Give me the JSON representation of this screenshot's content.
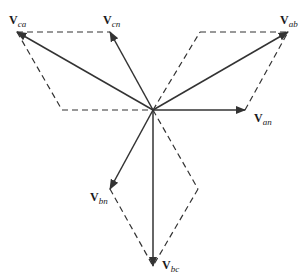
{
  "diagram": {
    "type": "phasor-diagram",
    "stroke_color": "#333333",
    "origin": {
      "x": 153,
      "y": 110
    },
    "phasors": [
      {
        "id": "van",
        "main": "V",
        "sub": "an",
        "tip": {
          "x": 245,
          "y": 110
        }
      },
      {
        "id": "vab",
        "main": "V",
        "sub": "ab",
        "tip": {
          "x": 288,
          "y": 32
        }
      },
      {
        "id": "vcn",
        "main": "V",
        "sub": "cn",
        "tip": {
          "x": 110,
          "y": 32
        }
      },
      {
        "id": "vca",
        "main": "V",
        "sub": "ca",
        "tip": {
          "x": 17,
          "y": 32
        }
      },
      {
        "id": "vbn",
        "main": "V",
        "sub": "bn",
        "tip": {
          "x": 110,
          "y": 189
        }
      },
      {
        "id": "vbc",
        "main": "V",
        "sub": "bc",
        "tip": {
          "x": 153,
          "y": 266
        }
      }
    ],
    "labels": {
      "van": {
        "main": "V",
        "sub": "an"
      },
      "vab": {
        "main": "V",
        "sub": "ab"
      },
      "vcn": {
        "main": "V",
        "sub": "cn"
      },
      "vca": {
        "main": "V",
        "sub": "ca"
      },
      "vbn": {
        "main": "V",
        "sub": "bn"
      },
      "vbc": {
        "main": "V",
        "sub": "bc"
      }
    }
  }
}
